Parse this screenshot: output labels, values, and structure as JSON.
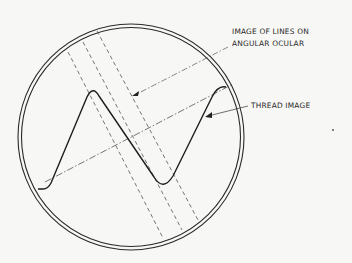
{
  "diagram": {
    "type": "optical field of view",
    "labels": {
      "lines_label_line1": "IMAGE OF LINES ON",
      "lines_label_line2": "ANGULAR OCULAR",
      "thread_label": "THREAD IMAGE"
    },
    "elements": [
      {
        "name": "field-of-view-circle",
        "kind": "double circle"
      },
      {
        "name": "thread-image",
        "kind": "sinusoidal thread profile"
      },
      {
        "name": "ocular-lines",
        "kind": "three parallel dashed lines"
      },
      {
        "name": "thread-axis",
        "kind": "dash-dot line"
      }
    ],
    "colors": {
      "ink": "#2a2a2a",
      "background": "#f7f7f5"
    }
  }
}
